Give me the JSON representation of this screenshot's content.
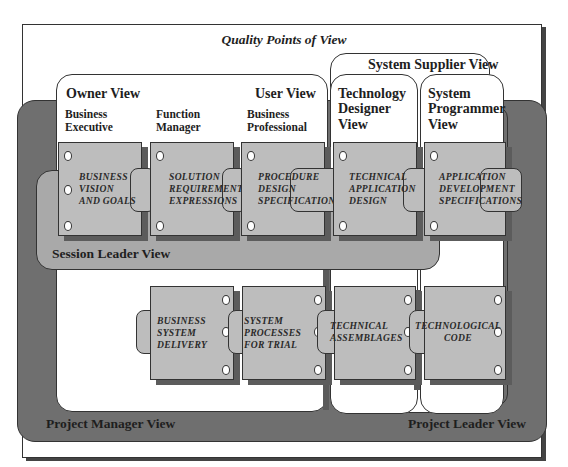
{
  "title": "Quality Points of View",
  "views": {
    "owner": "Owner View",
    "user": "User View",
    "system_supplier": "System Supplier View",
    "technology_designer": [
      "Technology",
      "Designer",
      "View"
    ],
    "system_programmer": [
      "System",
      "Programmer",
      "View"
    ],
    "session_leader": "Session Leader View",
    "project_manager": "Project Manager View",
    "project_leader": "Project Leader View"
  },
  "roles": {
    "business_executive": [
      "Business",
      "Executive"
    ],
    "function_manager": [
      "Function",
      "Manager"
    ],
    "business_professional": [
      "Business",
      "Professional"
    ]
  },
  "top_cards": [
    {
      "lines": [
        "BUSINESS",
        "VISION",
        "AND GOALS"
      ]
    },
    {
      "lines": [
        "SOLUTION",
        "REQUIREMENT",
        "EXPRESSIONS"
      ]
    },
    {
      "lines": [
        "PROCEDURE",
        "DESIGN",
        "SPECIFICATIONS"
      ]
    },
    {
      "lines": [
        "TECHNICAL",
        "APPLICATION",
        "DESIGN"
      ]
    },
    {
      "lines": [
        "APPLICATION",
        "DEVELOPMENT",
        "SPECIFICATIONS"
      ]
    }
  ],
  "bottom_cards": [
    {
      "lines": [
        "BUSINESS",
        "SYSTEM",
        "DELIVERY"
      ]
    },
    {
      "lines": [
        "SYSTEM",
        "PROCESSES",
        "FOR TRIAL"
      ]
    },
    {
      "lines": [
        "TECHNICAL",
        "ASSEMBLAGES"
      ]
    },
    {
      "lines": [
        "TECHNOLOGICAL",
        "CODE"
      ]
    }
  ],
  "colors": {
    "dark_gray": "#6f6f6f",
    "mid_gray": "#a9a9a9",
    "card_gray": "#bdbdbd",
    "outline": "#333333"
  }
}
